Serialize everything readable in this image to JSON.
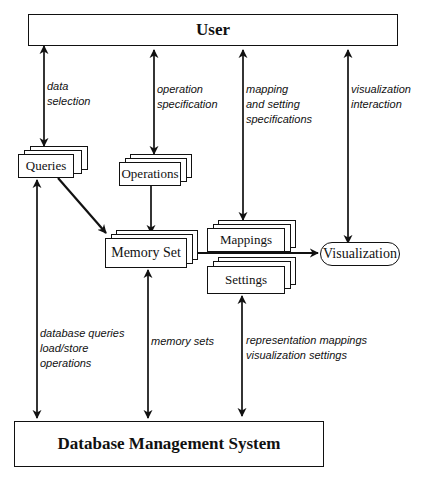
{
  "diagram": {
    "nodes": {
      "user": "User",
      "queries": "Queries",
      "operations": "Operations",
      "memory_set": "Memory Set",
      "mappings": "Mappings",
      "settings": "Settings",
      "visualization": "Visualization",
      "dbms": "Database Management System"
    },
    "edge_labels": {
      "data_selection": "data\nselection",
      "operation_specification": "operation\nspecification",
      "mapping_setting_specifications": "mapping\nand setting\nspecifications",
      "visualization_interaction": "visualization\ninteraction",
      "database_queries": "database queries\nload/store\noperations",
      "memory_sets": "memory sets",
      "representation_mappings": "representation mappings\nvisualization settings"
    },
    "edges": [
      {
        "from": "User",
        "to": "Queries",
        "label": "data selection",
        "bidirectional": true
      },
      {
        "from": "User",
        "to": "Operations",
        "label": "operation specification",
        "bidirectional": true
      },
      {
        "from": "User",
        "to": "Mappings",
        "label": "mapping and setting specifications",
        "bidirectional": true
      },
      {
        "from": "User",
        "to": "Visualization",
        "label": "visualization interaction",
        "bidirectional": true
      },
      {
        "from": "Queries",
        "to": "Memory Set",
        "bidirectional": false
      },
      {
        "from": "Operations",
        "to": "Memory Set",
        "bidirectional": false
      },
      {
        "from": "Memory Set",
        "to": "Visualization",
        "bidirectional": false
      },
      {
        "from": "Queries",
        "to": "Database Management System",
        "label": "database queries load/store operations",
        "bidirectional": true
      },
      {
        "from": "Memory Set",
        "to": "Database Management System",
        "label": "memory sets",
        "bidirectional": true
      },
      {
        "from": "Settings",
        "to": "Database Management System",
        "label": "representation mappings visualization settings",
        "bidirectional": true
      }
    ]
  }
}
